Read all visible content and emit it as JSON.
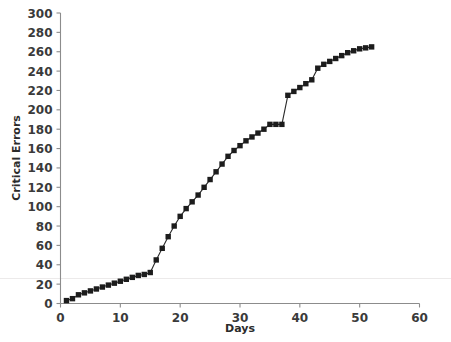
{
  "chart_data": {
    "type": "line",
    "title": "",
    "subtitle": "",
    "xlabel": "Days",
    "ylabel": "Critical Errors",
    "xlim": [
      0,
      60
    ],
    "ylim": [
      0,
      300
    ],
    "xticks": [
      0,
      10,
      20,
      30,
      40,
      50,
      60
    ],
    "yticks": [
      0,
      20,
      40,
      60,
      80,
      100,
      120,
      140,
      160,
      180,
      200,
      220,
      240,
      260,
      280,
      300
    ],
    "grid": false,
    "legend": null,
    "marker": "filled-square",
    "annotations": [],
    "series": [
      {
        "name": "Cumulative critical errors",
        "color": "#1c1c1c",
        "x": [
          1,
          2,
          3,
          4,
          5,
          6,
          7,
          8,
          9,
          10,
          11,
          12,
          13,
          14,
          15,
          16,
          17,
          18,
          19,
          20,
          21,
          22,
          23,
          24,
          25,
          26,
          27,
          28,
          29,
          30,
          31,
          32,
          33,
          34,
          35,
          36,
          37,
          38,
          39,
          40,
          41,
          42,
          43,
          44,
          45,
          46,
          47,
          48,
          49,
          50,
          51,
          52
        ],
        "values": [
          3,
          5,
          9,
          11,
          13,
          15,
          17,
          19,
          21,
          23,
          25,
          27,
          29,
          30,
          32,
          45,
          57,
          69,
          80,
          90,
          98,
          105,
          112,
          120,
          128,
          136,
          144,
          152,
          158,
          163,
          168,
          172,
          176,
          180,
          185,
          185,
          185,
          215,
          219,
          223,
          227,
          231,
          243,
          247,
          250,
          253,
          256,
          259,
          261,
          263,
          264,
          265
        ]
      }
    ]
  },
  "axes": {
    "y_label_text": "Critical Errors",
    "x_label_text": "Days"
  }
}
